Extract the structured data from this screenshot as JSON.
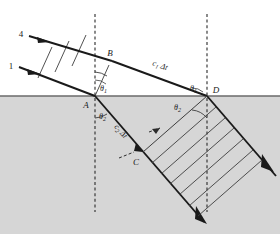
{
  "figure": {
    "colors": {
      "background_upper": "#ffffff",
      "background_lower": "#d6d6d6",
      "ink": "#1a1a1a",
      "thin_line": "#4a4a4a",
      "dashed_line": "#2b2b2b"
    },
    "labels": {
      "ray_top": "4",
      "ray_bottom": "1",
      "point_b": "B",
      "point_a": "A",
      "point_c": "C",
      "point_d": "D",
      "theta1_left": "θ",
      "theta1_left_sub": "1",
      "theta1_right": "θ",
      "theta1_right_sub": "1",
      "theta2_left": "θ",
      "theta2_left_sub": "2",
      "theta2_right": "θ",
      "theta2_right_sub": "2",
      "len_c1": "c",
      "len_c1_sub": "1",
      "len_c1_rest": " Δt",
      "len_c2": "c",
      "len_c2_sub": "2",
      "len_c2_rest": " Δt"
    }
  }
}
